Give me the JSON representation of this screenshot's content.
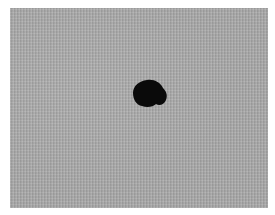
{
  "image": {
    "description": "Gray woven fabric texture with a single dark stain",
    "subject": "dark-spot",
    "colors": {
      "fabric": "#a9a9a9",
      "spot": "#0a0a0a",
      "border": "#ffffff"
    }
  }
}
